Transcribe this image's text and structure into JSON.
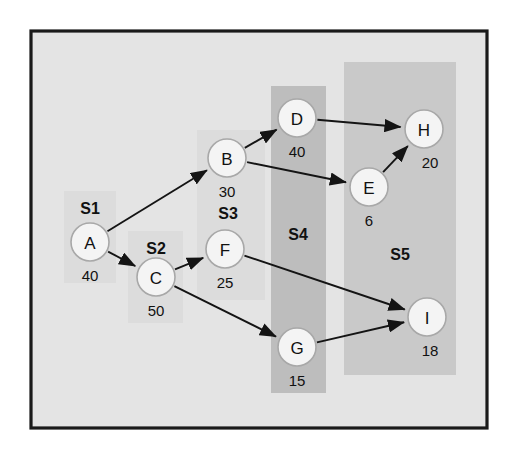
{
  "diagram": {
    "type": "directed-acyclic-graph",
    "background_color": "#e4e4e4",
    "border_color": "#1a1a1a",
    "node_fill": "#f4f4f4",
    "node_stroke": "#a8a8a8",
    "edge_color": "#141414"
  },
  "nodes": [
    {
      "id": "A",
      "label": "A",
      "weight": "40",
      "cx": 90,
      "cy": 242,
      "r": 19,
      "weight_x": 90,
      "weight_y": 281
    },
    {
      "id": "B",
      "label": "B",
      "weight": "30",
      "cx": 227,
      "cy": 158,
      "r": 19,
      "weight_x": 227,
      "weight_y": 197
    },
    {
      "id": "C",
      "label": "C",
      "weight": "50",
      "cx": 156,
      "cy": 277,
      "r": 19,
      "weight_x": 156,
      "weight_y": 316
    },
    {
      "id": "D",
      "label": "D",
      "weight": "40",
      "cx": 297,
      "cy": 118,
      "r": 19,
      "weight_x": 297,
      "weight_y": 157
    },
    {
      "id": "E",
      "label": "E",
      "weight": "6",
      "cx": 369,
      "cy": 187,
      "r": 19,
      "weight_x": 369,
      "weight_y": 226
    },
    {
      "id": "F",
      "label": "F",
      "weight": "25",
      "cx": 225,
      "cy": 249,
      "r": 19,
      "weight_x": 225,
      "weight_y": 288
    },
    {
      "id": "G",
      "label": "G",
      "weight": "15",
      "cx": 297,
      "cy": 347,
      "r": 19,
      "weight_x": 297,
      "weight_y": 386
    },
    {
      "id": "H",
      "label": "H",
      "weight": "20",
      "cx": 424,
      "cy": 129,
      "r": 19,
      "weight_x": 430,
      "weight_y": 168
    },
    {
      "id": "I",
      "label": "I",
      "weight": "18",
      "cx": 427,
      "cy": 317,
      "r": 19,
      "weight_x": 430,
      "weight_y": 356
    }
  ],
  "edges": [
    {
      "from": "A",
      "to": "B"
    },
    {
      "from": "A",
      "to": "C"
    },
    {
      "from": "B",
      "to": "D"
    },
    {
      "from": "B",
      "to": "E"
    },
    {
      "from": "C",
      "to": "F"
    },
    {
      "from": "C",
      "to": "G"
    },
    {
      "from": "D",
      "to": "H"
    },
    {
      "from": "E",
      "to": "H"
    },
    {
      "from": "F",
      "to": "I"
    },
    {
      "from": "G",
      "to": "I"
    }
  ],
  "regions": [
    {
      "id": "S1",
      "label": "S1",
      "x": 64,
      "y": 191,
      "w": 52,
      "h": 92,
      "shade": "region-light",
      "label_x": 90,
      "label_y": 214
    },
    {
      "id": "S2",
      "label": "S2",
      "x": 128,
      "y": 231,
      "w": 55,
      "h": 92,
      "shade": "region-light",
      "label_x": 156,
      "label_y": 254
    },
    {
      "id": "S3",
      "label": "S3",
      "x": 197,
      "y": 130,
      "w": 68,
      "h": 170,
      "shade": "region-light",
      "label_x": 228,
      "label_y": 219
    },
    {
      "id": "S4",
      "label": "S4",
      "x": 271,
      "y": 86,
      "w": 55,
      "h": 307,
      "shade": "region-dark",
      "label_x": 298,
      "label_y": 240
    },
    {
      "id": "S5",
      "label": "S5",
      "x": 344,
      "y": 62,
      "w": 112,
      "h": 313,
      "shade": "region-mid",
      "label_x": 400,
      "label_y": 260
    }
  ],
  "frame": {
    "x": 31,
    "y": 31,
    "w": 456,
    "h": 397
  }
}
